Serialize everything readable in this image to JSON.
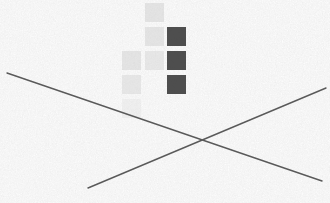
{
  "canvas": {
    "width": 330,
    "height": 203,
    "background_color": "#f4f4f4",
    "texture": "noise-speckle",
    "texture_color_light": "#ffffff",
    "texture_color_dark": "#d4d4d4"
  },
  "lines": {
    "stroke_color": "#5a5a5a",
    "stroke_width": 1.4,
    "items": [
      {
        "name": "descending-diagonal-line",
        "x1": 7,
        "y1": 73,
        "x2": 322,
        "y2": 181
      },
      {
        "name": "ascending-diagonal-line",
        "x1": 88,
        "y1": 188,
        "x2": 326,
        "y2": 88
      }
    ],
    "intersection": {
      "x": 185,
      "y": 143
    }
  },
  "squares": {
    "size": 19,
    "dark_color": "#4e4e4e",
    "light_color": "#e2e2e2",
    "faint_color": "#eaeaea",
    "items": [
      {
        "name": "dark-square-1",
        "x": 167,
        "y": 27,
        "shade": "dark",
        "color": "#4e4e4e",
        "opacity": 1.0
      },
      {
        "name": "dark-square-2",
        "x": 167,
        "y": 51,
        "shade": "dark",
        "color": "#4e4e4e",
        "opacity": 1.0
      },
      {
        "name": "dark-square-3",
        "x": 167,
        "y": 75,
        "shade": "dark",
        "color": "#4e4e4e",
        "opacity": 1.0
      },
      {
        "name": "light-square-1",
        "x": 145,
        "y": 3,
        "shade": "light",
        "color": "#dcdcdc",
        "opacity": 0.75
      },
      {
        "name": "light-square-2",
        "x": 145,
        "y": 27,
        "shade": "light",
        "color": "#dcdcdc",
        "opacity": 0.7
      },
      {
        "name": "light-square-3",
        "x": 145,
        "y": 51,
        "shade": "light",
        "color": "#dcdcdc",
        "opacity": 0.6
      },
      {
        "name": "light-square-4",
        "x": 122,
        "y": 51,
        "shade": "light",
        "color": "#dcdcdc",
        "opacity": 0.7
      },
      {
        "name": "light-square-5",
        "x": 122,
        "y": 75,
        "shade": "light",
        "color": "#dcdcdc",
        "opacity": 0.62
      },
      {
        "name": "light-square-6",
        "x": 122,
        "y": 99,
        "shade": "faint",
        "color": "#e4e4e4",
        "opacity": 0.45
      }
    ]
  }
}
